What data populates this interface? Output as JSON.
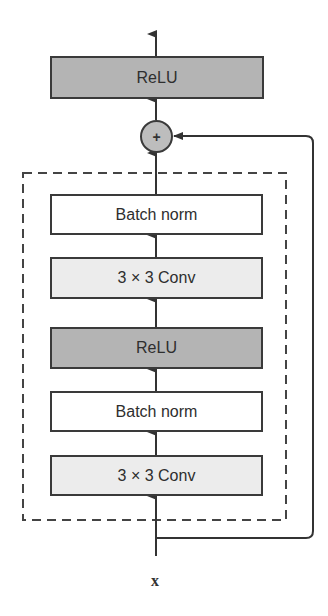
{
  "diagram": {
    "output_relu": {
      "label": "ReLU"
    },
    "sum_node": {
      "label": "+"
    },
    "residual_branch": {
      "layers": [
        {
          "label": "Batch norm",
          "type": "batchnorm"
        },
        {
          "label": "3 × 3 Conv",
          "type": "conv"
        },
        {
          "label": "ReLU",
          "type": "relu"
        },
        {
          "label": "Batch norm",
          "type": "batchnorm"
        },
        {
          "label": "3 × 3 Conv",
          "type": "conv"
        }
      ]
    },
    "input_label": "x",
    "colors": {
      "relu_fill": "#b4b4b4",
      "conv_fill": "#ececec",
      "batchnorm_fill": "#ffffff",
      "stroke": "#3a3a3a"
    }
  }
}
